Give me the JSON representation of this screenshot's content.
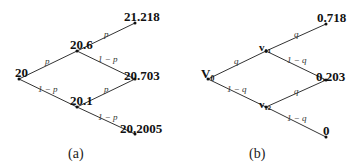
{
  "diagram_a": {
    "caption": "(a)",
    "nodes": {
      "root": "20",
      "up": "20.6",
      "down": "20.1",
      "uu": "21.218",
      "ud": "20.703",
      "dd": "20.2005"
    },
    "edges": {
      "root_up": "p",
      "root_down": "1 − p",
      "up_uu": "p",
      "up_ud": "1 − p",
      "down_ud": "p",
      "down_dd": "1 − p"
    }
  },
  "diagram_b": {
    "caption": "(b)",
    "nodes": {
      "root": "V₀",
      "up": "v₁₁",
      "down": "v₁₂",
      "uu": "0.718",
      "ud": "0.203",
      "dd": "0"
    },
    "edges": {
      "root_up": "q",
      "root_down": "1 − q",
      "up_uu": "q",
      "up_ud": "1 − q",
      "down_ud": "q",
      "down_dd": "1 − q"
    }
  }
}
